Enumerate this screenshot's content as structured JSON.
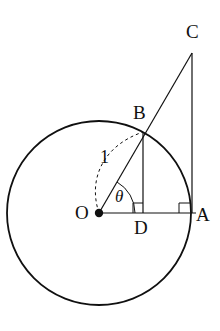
{
  "figure": {
    "kind": "geometry-diagram",
    "background_color": "#ffffff",
    "stroke_color": "#101010",
    "labels": {
      "center": "O",
      "circle_point_right": "A",
      "circle_point_b": "B",
      "apex": "C",
      "foot": "D",
      "radius_value": "1",
      "angle": "θ"
    },
    "geometry": {
      "center_x": 99,
      "center_y": 213,
      "radius_px": 92,
      "radius_value": 1,
      "point_o": {
        "x": 99,
        "y": 213
      },
      "point_a": {
        "x": 191,
        "y": 213
      },
      "point_b": {
        "x": 143,
        "y": 132
      },
      "point_c": {
        "x": 192,
        "y": 53
      },
      "point_d": {
        "x": 143,
        "y": 213
      },
      "angle_theta_degrees": 60,
      "right_angle_marks": [
        {
          "at": "D",
          "x": 143,
          "y": 213
        },
        {
          "at": "A",
          "x": 191,
          "y": 213
        }
      ],
      "dashed_arc": {
        "from": {
          "x": 99,
          "y": 213
        },
        "to": {
          "x": 143,
          "y": 132
        },
        "style": "dashed"
      },
      "segments": [
        {
          "name": "OA",
          "from": "O",
          "to": "A",
          "style": "solid"
        },
        {
          "name": "AC",
          "from": "A",
          "to": "C",
          "style": "solid"
        },
        {
          "name": "OC",
          "from": "O",
          "to": "C",
          "style": "solid"
        },
        {
          "name": "BD",
          "from": "B",
          "to": "D",
          "style": "solid"
        }
      ]
    }
  }
}
